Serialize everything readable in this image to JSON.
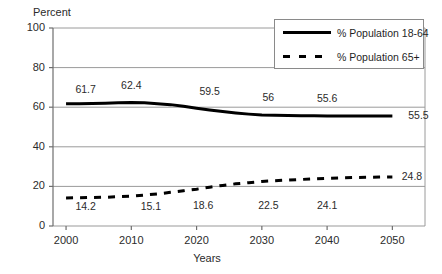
{
  "chart_data": {
    "type": "line",
    "title": "",
    "xlabel": "Years",
    "ylabel": "Percent",
    "x": [
      2000,
      2010,
      2020,
      2030,
      2040,
      2050
    ],
    "xlim": [
      1998,
      2055
    ],
    "ylim": [
      0,
      100
    ],
    "xticks": [
      "2000",
      "2010",
      "2020",
      "2030",
      "2040",
      "2050"
    ],
    "yticks": [
      "0",
      "20",
      "40",
      "60",
      "80",
      "100"
    ],
    "grid": true,
    "legend_position": "top-right",
    "series": [
      {
        "name": "% Population 18-64",
        "style": "solid",
        "color": "#000000",
        "x": [
          2000,
          2002,
          2004,
          2006,
          2008,
          2010,
          2012,
          2014,
          2016,
          2018,
          2020,
          2022,
          2024,
          2026,
          2028,
          2030,
          2032,
          2034,
          2036,
          2038,
          2040,
          2042,
          2044,
          2046,
          2048,
          2050
        ],
        "values": [
          61.7,
          61.8,
          61.9,
          62.0,
          62.2,
          62.4,
          62.2,
          61.8,
          61.3,
          60.5,
          59.5,
          58.6,
          57.8,
          57.1,
          56.5,
          56.0,
          55.9,
          55.8,
          55.7,
          55.7,
          55.6,
          55.6,
          55.6,
          55.5,
          55.5,
          55.5
        ],
        "labels": [
          {
            "text": "61.7",
            "x": 2003,
            "y": 68.5
          },
          {
            "text": "62.4",
            "x": 2010,
            "y": 70.5
          },
          {
            "text": "59.5",
            "x": 2022,
            "y": 67.5
          },
          {
            "text": "56",
            "x": 2031,
            "y": 64.5
          },
          {
            "text": "55.6",
            "x": 2040,
            "y": 64.0
          },
          {
            "text": "55.5",
            "x": 2054,
            "y": 55.5
          }
        ]
      },
      {
        "name": "% Population 65+",
        "style": "dashed",
        "color": "#000000",
        "x": [
          2000,
          2002,
          2004,
          2006,
          2008,
          2010,
          2012,
          2014,
          2016,
          2018,
          2020,
          2022,
          2024,
          2026,
          2028,
          2030,
          2032,
          2034,
          2036,
          2038,
          2040,
          2042,
          2044,
          2046,
          2048,
          2050
        ],
        "values": [
          14.2,
          14.3,
          14.4,
          14.5,
          14.8,
          15.1,
          15.6,
          16.2,
          17.0,
          17.8,
          18.6,
          19.6,
          20.5,
          21.3,
          21.9,
          22.5,
          22.9,
          23.2,
          23.5,
          23.8,
          24.1,
          24.3,
          24.5,
          24.6,
          24.7,
          24.8
        ],
        "labels": [
          {
            "text": "14.2",
            "x": 2003,
            "y": 9.5
          },
          {
            "text": "15.1",
            "x": 2013,
            "y": 9.5
          },
          {
            "text": "18.6",
            "x": 2021,
            "y": 10.0
          },
          {
            "text": "22.5",
            "x": 2031,
            "y": 10.0
          },
          {
            "text": "24.1",
            "x": 2040,
            "y": 10.0
          },
          {
            "text": "24.8",
            "x": 2053,
            "y": 24.8
          }
        ]
      }
    ]
  },
  "legend": {
    "entries": [
      {
        "label": "% Population 18-64",
        "style": "solid"
      },
      {
        "label": "% Population 65+",
        "style": "dashed"
      }
    ]
  },
  "colors": {
    "axis": "#6e6e6e",
    "grid": "#9a9a9a",
    "line": "#000000",
    "text": "#2b2b2b",
    "background": "#ffffff"
  }
}
